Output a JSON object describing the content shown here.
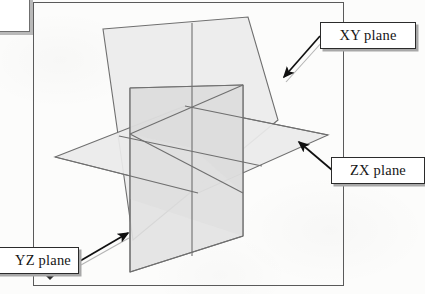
{
  "figure": {
    "type": "3d-coordinate-planes-diagram",
    "frame": {
      "border_color": "#5a5a5a"
    },
    "background_color": "#fcfcfb"
  },
  "labels": {
    "xy_plane": "XY plane",
    "zx_plane": "ZX plane",
    "yz_plane": "YZ plane"
  },
  "planes": [
    {
      "name": "xy_plane",
      "label": "XY plane",
      "orientation": "vertical-right-facing",
      "fill": "#e9e9e9",
      "stroke": "#6b6b6b",
      "vertices": [
        [
          103,
          29
        ],
        [
          248,
          17
        ],
        [
          278,
          120
        ],
        [
          133,
          240
        ]
      ]
    },
    {
      "name": "zx_plane",
      "label": "ZX plane",
      "orientation": "horizontal",
      "fill": "#ebebeb",
      "stroke": "#6b6b6b",
      "vertices": [
        [
          55,
          157
        ],
        [
          185,
          106
        ],
        [
          328,
          135
        ],
        [
          198,
          193
        ]
      ]
    },
    {
      "name": "yz_plane",
      "label": "YZ plane",
      "orientation": "vertical-left-facing",
      "fill": "#e4e4e4",
      "stroke": "#6b6b6b",
      "vertices": [
        [
          130,
          88
        ],
        [
          243,
          85
        ],
        [
          243,
          236
        ],
        [
          130,
          272
        ]
      ]
    }
  ],
  "intersection_point": [
    192,
    148
  ],
  "arrows": [
    {
      "name": "arrow-xy",
      "from": [
        321,
        36
      ],
      "to": [
        283,
        78
      ],
      "points_to": "xy_plane"
    },
    {
      "name": "arrow-zx",
      "from": [
        332,
        170
      ],
      "to": [
        297,
        140
      ],
      "points_to": "zx_plane"
    },
    {
      "name": "arrow-yz",
      "from": [
        80,
        260
      ],
      "to": [
        130,
        233
      ],
      "points_to": "yz_plane"
    }
  ],
  "colors": {
    "line": "#6b6b6b",
    "arrow": "#111111",
    "box_border": "#2b2b2b",
    "box_shadow": "#a8a8a8",
    "plane_fill_light": "#ececec",
    "plane_fill_mid": "#e4e4e4",
    "plane_fill_dark": "#dcdcdc"
  }
}
